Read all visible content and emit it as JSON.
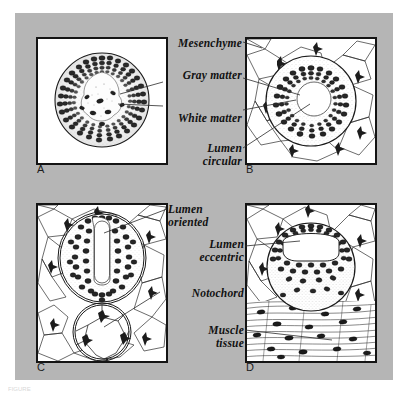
{
  "figure": {
    "background_color": "#b5b5b5",
    "page_color": "#ffffff",
    "ink_color": "#141414",
    "caption": "FIGURE"
  },
  "panels": [
    {
      "id": "A",
      "letter": "A",
      "description": "Circular neural tube cross-section, stippled interior with dense peripheral cells and light central lumen region"
    },
    {
      "id": "B",
      "letter": "B",
      "description": "Neural tube with ring of dark cells around a circular white lumen, surrounded by mesenchyme"
    },
    {
      "id": "C",
      "letter": "C",
      "description": "Oval neural tube with vertical slit-like lumen above a circular notochord with vacuolated cells"
    },
    {
      "id": "D",
      "letter": "D",
      "description": "Neural tube with eccentric U-shaped lumen located dorsally, above striated muscle tissue"
    }
  ],
  "labels": [
    {
      "key": "mesenchyme",
      "text": "Mesenchyme"
    },
    {
      "key": "gray_matter",
      "text": "Gray  matter"
    },
    {
      "key": "white_matter",
      "text": "White matter"
    },
    {
      "key": "lumen_circular",
      "text": "Lumen\ncircular"
    },
    {
      "key": "lumen_oriented",
      "text": "Lumen\noriented"
    },
    {
      "key": "lumen_eccentric",
      "text": "Lumen\neccentric"
    },
    {
      "key": "notochord",
      "text": "Notochord"
    },
    {
      "key": "muscle_tissue",
      "text": "Muscle\ntissue"
    }
  ]
}
